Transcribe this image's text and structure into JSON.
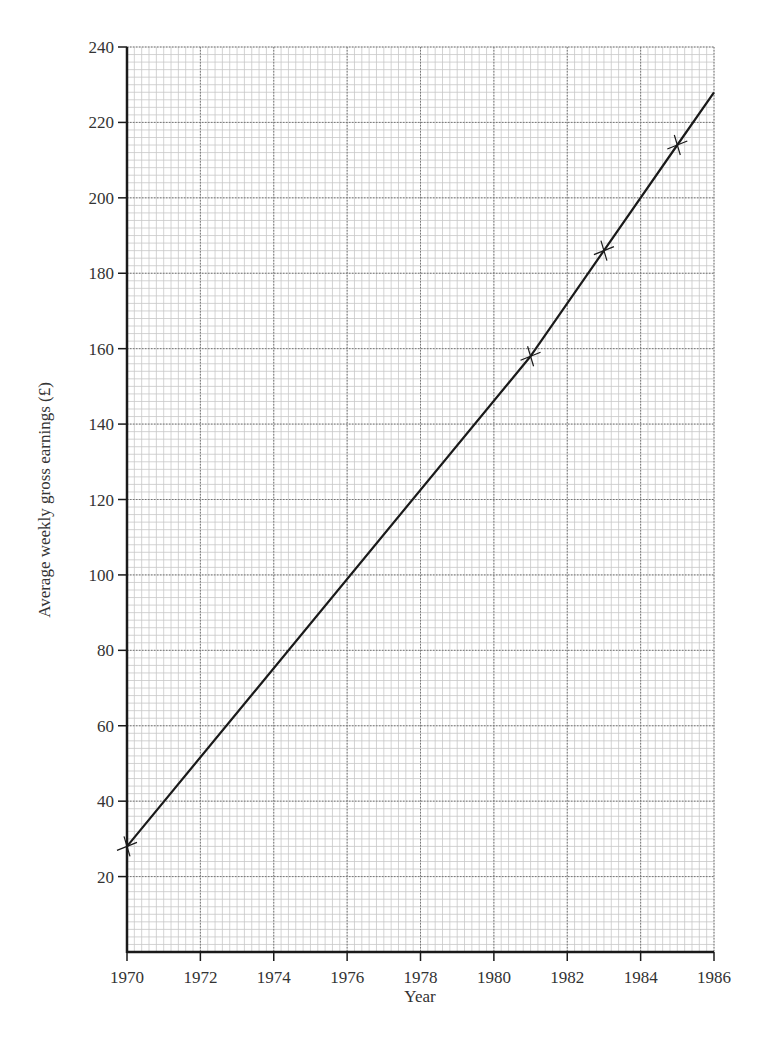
{
  "chart_data": {
    "type": "line",
    "title": "",
    "xlabel": "Year",
    "ylabel": "Average weekly gross earnings (£)",
    "xlim": [
      1970,
      1986
    ],
    "ylim": [
      0,
      240
    ],
    "x_ticks": [
      1970,
      1972,
      1974,
      1976,
      1978,
      1980,
      1982,
      1984,
      1986
    ],
    "y_ticks": [
      20,
      40,
      60,
      80,
      100,
      120,
      140,
      160,
      180,
      200,
      220,
      240
    ],
    "grid": {
      "major": true,
      "minor": true,
      "minor_x_step": 0.2,
      "minor_y_step": 2
    },
    "series": [
      {
        "name": "Average weekly gross earnings",
        "marker": "cross",
        "points": [
          {
            "x": 1970,
            "y": 28
          },
          {
            "x": 1981,
            "y": 158
          },
          {
            "x": 1983,
            "y": 186
          },
          {
            "x": 1985,
            "y": 214
          }
        ],
        "line": [
          {
            "x": 1970,
            "y": 28
          },
          {
            "x": 1981,
            "y": 158
          },
          {
            "x": 1983,
            "y": 186
          },
          {
            "x": 1985,
            "y": 214
          },
          {
            "x": 1986,
            "y": 228
          }
        ]
      }
    ],
    "colors": {
      "line": "#1a1a1a",
      "grid_minor": "#c8c8c8",
      "grid_major": "#777777",
      "axis": "#1a1a1a"
    }
  }
}
